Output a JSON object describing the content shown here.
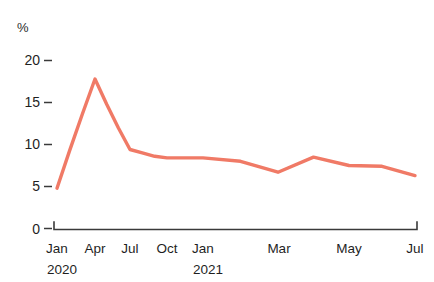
{
  "chart_data": {
    "type": "line",
    "title": "",
    "subtitle": "",
    "xlabel": "",
    "ylabel": "%",
    "unit_label": "%",
    "ylim": [
      0,
      21
    ],
    "xlim": [
      "2020-01",
      "2021-07"
    ],
    "grid": false,
    "legend": "none",
    "line_color": "#F07A66",
    "axis_color": "#3A3A3A",
    "text_color": "#1F1F1F",
    "background": "#FFFFFF",
    "y_ticks": [
      0,
      5,
      10,
      15,
      20
    ],
    "y_tick_labels": [
      "0",
      "5",
      "10",
      "15",
      "20"
    ],
    "x_tick_labels": [
      "Jan",
      "Apr",
      "Jul",
      "Oct",
      "Jan",
      "Mar",
      "May",
      "Jul"
    ],
    "x_tick_positions": [
      "2020-01",
      "2020-04",
      "2020-07",
      "2020-10",
      "2021-01",
      "2021-03",
      "2021-05",
      "2021-07"
    ],
    "year_labels": [
      "2020",
      "2021"
    ],
    "year_label_positions": [
      "2020-01",
      "2021-01"
    ],
    "x": [
      "2020-01",
      "2020-02",
      "2020-03",
      "2020-04",
      "2020-05",
      "2020-06",
      "2020-07",
      "2020-08",
      "2020-09",
      "2020-10",
      "2020-11",
      "2020-12",
      "2021-01",
      "2021-02",
      "2021-03",
      "2021-04",
      "2021-05",
      "2021-06",
      "2021-07"
    ],
    "categories": [
      "Jan 2020",
      "Feb 2020",
      "Mar 2020",
      "Apr 2020",
      "May 2020",
      "Jun 2020",
      "Jul 2020",
      "Aug 2020",
      "Sep 2020",
      "Oct 2020",
      "Nov 2020",
      "Dec 2020",
      "Jan 2021",
      "Feb 2021",
      "Mar 2021",
      "Apr 2021",
      "May 2021",
      "Jun 2021",
      "Jul 2021"
    ],
    "values": [
      4.8,
      9.3,
      13.6,
      17.8,
      14.8,
      12.0,
      9.4,
      9.0,
      8.6,
      8.4,
      8.4,
      8.4,
      8.4,
      8.0,
      6.7,
      8.5,
      7.5,
      7.4,
      6.3
    ]
  }
}
